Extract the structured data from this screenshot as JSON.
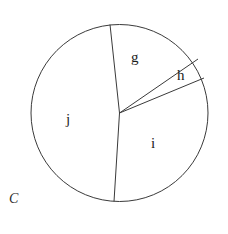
{
  "figure": {
    "caption": "C",
    "background_color": "#ffffff",
    "stroke_color": "#3a3a3a",
    "text_color": "#1b1b1b"
  },
  "circle": {
    "center_x": 119.5,
    "center_y": 113,
    "radius": 88.5
  },
  "sectors": [
    {
      "key": "g",
      "label": "g",
      "label_x": 131,
      "label_y": 50
    },
    {
      "key": "h",
      "label": "h",
      "label_x": 177,
      "label_y": 68
    },
    {
      "key": "i",
      "label": "i",
      "label_x": 151,
      "label_y": 136
    },
    {
      "key": "j",
      "label": "j",
      "label_x": 66,
      "label_y": 112
    }
  ],
  "radii": [
    {
      "name": "radius-top",
      "x1": 119.5,
      "y1": 113,
      "x2": 110,
      "y2": 24.5
    },
    {
      "name": "radius-upper-right",
      "x1": 119.5,
      "y1": 113,
      "x2": 198,
      "y2": 59
    },
    {
      "name": "radius-right",
      "x1": 119.5,
      "y1": 113,
      "x2": 204,
      "y2": 78
    },
    {
      "name": "radius-bottom",
      "x1": 119.5,
      "y1": 113,
      "x2": 114,
      "y2": 201.5
    }
  ]
}
